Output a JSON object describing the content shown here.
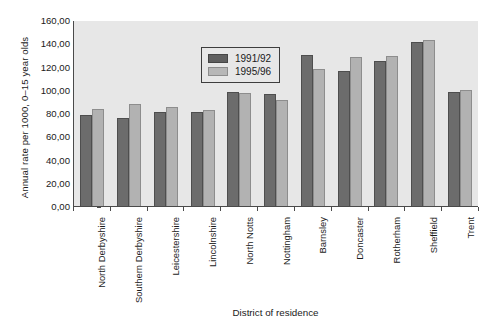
{
  "chart_data": {
    "type": "bar",
    "title": "",
    "xlabel": "District of residence",
    "ylabel": "Annual rate per 1000, 0–15 year olds",
    "categories": [
      "North Derbyshire",
      "Southern Derbyshire",
      "Leicestershire",
      "Lincolnshire",
      "North Notts",
      "Nottingham",
      "Barnsley",
      "Doncaster",
      "Rotherham",
      "Sheffield",
      "Trent"
    ],
    "series": [
      {
        "name": "1991/92",
        "color": "#6c6c6c",
        "values": [
          78.0,
          75.5,
          80.5,
          80.5,
          98.0,
          96.0,
          129.5,
          116.0,
          124.5,
          141.0,
          98.5
        ]
      },
      {
        "name": "1995/96",
        "color": "#b2b2b2",
        "values": [
          83.5,
          88.0,
          85.5,
          82.5,
          97.0,
          91.0,
          118.0,
          128.0,
          129.0,
          143.0,
          100.0
        ]
      }
    ],
    "ylim": [
      0,
      160
    ],
    "ytick_labels": [
      "160,00",
      "140,00",
      "120,00",
      "100,00",
      "80,00",
      "60,00",
      "40,00",
      "20,00",
      "0,00"
    ],
    "ytick_values": [
      160,
      140,
      120,
      100,
      80,
      60,
      40,
      20,
      0
    ],
    "grid": false,
    "legend_position": "upper-left-inside",
    "plot_background": "#e7e7e7",
    "axis_color": "#4a4a4a"
  },
  "legend": {
    "entries": [
      {
        "label": "1991/92"
      },
      {
        "label": "1995/96"
      }
    ]
  }
}
